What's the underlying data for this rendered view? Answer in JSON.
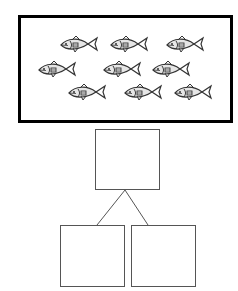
{
  "diagram": {
    "type": "part-part-whole",
    "frame": {
      "content": "fish",
      "fish_count": 9,
      "rows": [
        {
          "count": 3
        },
        {
          "count": 3
        },
        {
          "count": 3
        }
      ]
    },
    "whole_box": {
      "label": ""
    },
    "part_boxes": [
      {
        "label": ""
      },
      {
        "label": ""
      }
    ],
    "colors": {
      "frame_border": "#000000",
      "box_border": "#555555",
      "fish_stroke": "#333333",
      "fish_fill": "#e6e6e6"
    }
  }
}
